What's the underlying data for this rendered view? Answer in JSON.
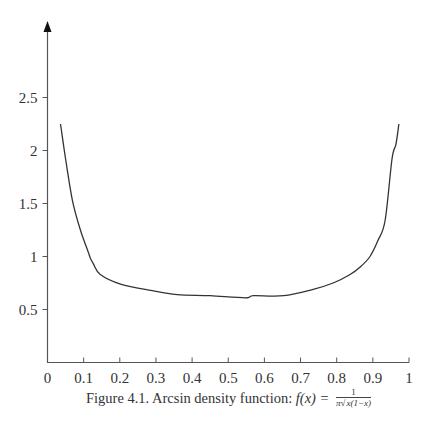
{
  "figure": {
    "caption_prefix": "Figure 4.1.  Arcsin density function:",
    "formula_lhs": "f(x) =",
    "formula_numerator": "1",
    "formula_denominator_pi": "π",
    "formula_denominator_radical": "√",
    "formula_denominator_radicand": "x(1−x)"
  },
  "chart_data": {
    "type": "line",
    "xlabel": "",
    "ylabel": "",
    "xlim": [
      0,
      1
    ],
    "ylim": [
      0,
      3.2
    ],
    "grid": false,
    "legend": null,
    "x_ticks": [
      0,
      0.1,
      0.2,
      0.3,
      0.4,
      0.5,
      0.6,
      0.7,
      0.8,
      0.9,
      1
    ],
    "x_tick_labels": [
      "0",
      "0.1",
      "0.2",
      "0.3",
      "0.4",
      "0.5",
      "0.6",
      "0.7",
      "0.8",
      "0.9",
      "1"
    ],
    "y_ticks": [
      0.5,
      1,
      1.5,
      2,
      2.5
    ],
    "y_tick_labels": [
      "0.5",
      "1",
      "1.5",
      "2",
      "2.5"
    ],
    "y_axis_arrow": true,
    "series": [
      {
        "name": "f(x)",
        "color": "#333333",
        "x": [
          0.036,
          0.05,
          0.069,
          0.091,
          0.113,
          0.119,
          0.127,
          0.146,
          0.202,
          0.285,
          0.359,
          0.45,
          0.547,
          0.57,
          0.653,
          0.735,
          0.79,
          0.837,
          0.865,
          0.892,
          0.914,
          0.934,
          0.953,
          0.964,
          0.972
        ],
        "y": [
          2.25,
          1.92,
          1.53,
          1.25,
          1.04,
          0.98,
          0.93,
          0.83,
          0.74,
          0.68,
          0.64,
          0.63,
          0.61,
          0.63,
          0.63,
          0.69,
          0.75,
          0.83,
          0.9,
          1.0,
          1.15,
          1.34,
          1.92,
          2.06,
          2.25
        ]
      }
    ]
  }
}
